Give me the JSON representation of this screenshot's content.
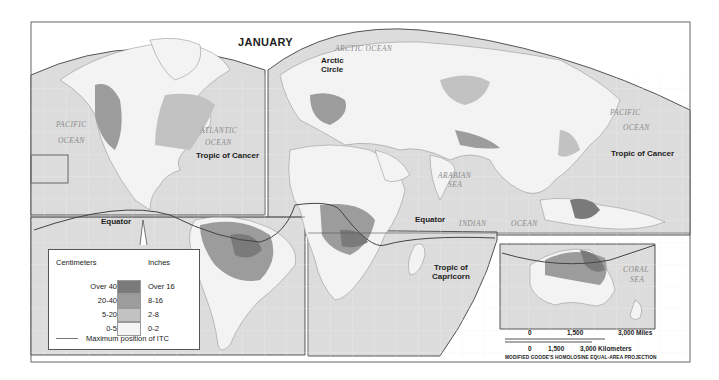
{
  "map": {
    "title": "JANUARY",
    "projection": "MODIFIED GOODE'S HOMOLOSINE EQUAL-AREA PROJECTION",
    "colors": {
      "frame": "#555555",
      "ocean": "#dcdcdc",
      "land": "#f3f3f3",
      "over_16": "#7a7a7a",
      "8_16": "#9c9c9c",
      "2_8": "#c2c2c2",
      "0_2": "#f4f4f4",
      "itc_line": "#444444"
    },
    "labels": {
      "arctic_circle_1": "Arctic",
      "arctic_circle_2": "Circle",
      "tropic_cancer_west": "Tropic of Cancer",
      "tropic_cancer_east": "Tropic of Cancer",
      "equator_west": "Equator",
      "equator_east": "Equator",
      "tropic_capricorn_1": "Tropic of",
      "tropic_capricorn_2": "Capricorn"
    },
    "oceans": {
      "pacific_west_1": "PACIFIC",
      "pacific_west_2": "OCEAN",
      "atlantic_1": "ATLANTIC",
      "atlantic_2": "OCEAN",
      "arctic": "ARCTIC OCEAN",
      "pacific_east_1": "PACIFIC",
      "pacific_east_2": "OCEAN",
      "arabian_1": "ARABIAN",
      "arabian_2": "SEA",
      "indian_1": "INDIAN",
      "indian_2": "OCEAN",
      "coral_1": "CORAL",
      "coral_2": "SEA"
    }
  },
  "legend": {
    "header_cm": "Centimeters",
    "header_in": "Inches",
    "rows": [
      {
        "cm": "Over 40",
        "in": "Over 16",
        "color": "#7a7a7a"
      },
      {
        "cm": "20-40",
        "in": "8-16",
        "color": "#9c9c9c"
      },
      {
        "cm": "5-20",
        "in": "2-8",
        "color": "#c2c2c2"
      },
      {
        "cm": "0-5",
        "in": "0-2",
        "color": "#f4f4f4"
      }
    ],
    "itc_label": "Maximum position of ITC"
  },
  "scale_bar": {
    "miles": {
      "zero": "0",
      "mid": "1,500",
      "end": "3,000 Miles"
    },
    "km": {
      "zero": "0",
      "mid": "1,500",
      "end": "3,000 Kilometers"
    }
  }
}
